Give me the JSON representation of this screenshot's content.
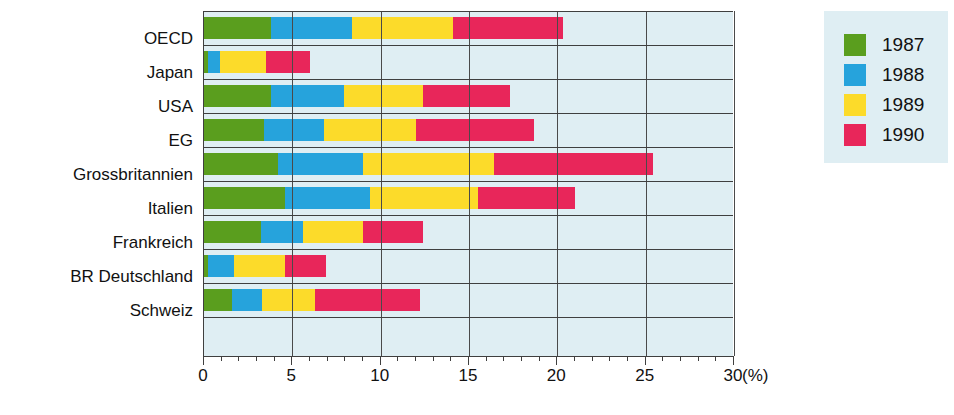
{
  "chart_data": {
    "type": "bar",
    "orientation": "horizontal",
    "stacked": true,
    "title": "",
    "xlabel": "(%)",
    "ylabel": "",
    "xlim": [
      0,
      30
    ],
    "xticks": [
      0,
      5,
      10,
      15,
      20,
      25,
      30
    ],
    "xtick_labels": [
      "0",
      "5",
      "10",
      "15",
      "20",
      "25",
      "30"
    ],
    "minor_tick_step": 1,
    "grid": true,
    "unit": "(%)",
    "legend_position": "right",
    "categories": [
      "OECD",
      "Japan",
      "USA",
      "EG",
      "Grossbritannien",
      "Italien",
      "Frankreich",
      "BR Deutschland",
      "Schweiz"
    ],
    "series": [
      {
        "name": "1987",
        "color": "#5a9e1e",
        "values": [
          3.8,
          0.2,
          3.8,
          3.4,
          4.2,
          4.6,
          3.2,
          0.2,
          1.6
        ]
      },
      {
        "name": "1988",
        "color": "#26a3dc",
        "values": [
          4.6,
          0.7,
          4.1,
          3.4,
          4.8,
          4.8,
          2.4,
          1.5,
          1.7
        ]
      },
      {
        "name": "1989",
        "color": "#fcdb2a",
        "values": [
          5.7,
          2.6,
          4.5,
          5.2,
          7.4,
          6.1,
          3.4,
          2.9,
          3.0
        ]
      },
      {
        "name": "1990",
        "color": "#e8265a",
        "values": [
          6.2,
          2.5,
          4.9,
          6.7,
          9.0,
          5.5,
          3.4,
          2.3,
          5.9
        ]
      }
    ],
    "totals": [
      20.3,
      6.0,
      17.3,
      18.7,
      25.4,
      21.0,
      12.4,
      6.9,
      12.2
    ]
  },
  "legend": {
    "items": [
      {
        "label": "1987",
        "color": "#5a9e1e"
      },
      {
        "label": "1988",
        "color": "#26a3dc"
      },
      {
        "label": "1989",
        "color": "#fcdb2a"
      },
      {
        "label": "1990",
        "color": "#e8265a"
      }
    ]
  },
  "colors": {
    "plot_background": "#dfeef3",
    "axis": "#3f3f3f",
    "grid": "#4a4a4a",
    "text": "#111111"
  }
}
